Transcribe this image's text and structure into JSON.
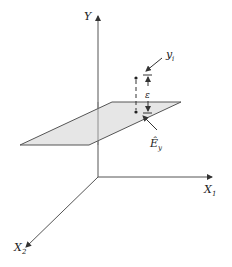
{
  "diagram": {
    "labels": {
      "y_axis": "Y",
      "x1_axis": "X",
      "x1_sub": "1",
      "x2_axis": "X",
      "x2_sub": "2",
      "observed": "y",
      "observed_sub": "i",
      "error": "ε",
      "plane": "Ê",
      "plane_sub": "y"
    },
    "colors": {
      "line": "#555555",
      "plane_fill": "#e6e6e6",
      "plane_stroke": "#555555",
      "text": "#222222"
    }
  }
}
